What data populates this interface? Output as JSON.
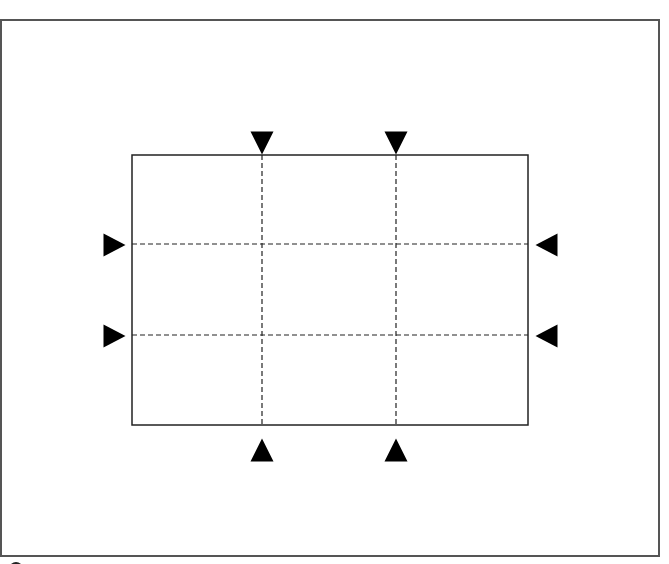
{
  "diagram": {
    "colors": {
      "background": "#ffffff",
      "frame_stroke": "#555555",
      "rect_stroke": "#222222",
      "grid_stroke": "#222222",
      "marker_fill": "#000000"
    },
    "outer_frame": {
      "x": 1,
      "y": 20,
      "width": 658,
      "height": 536
    },
    "inner_rect": {
      "x": 132,
      "y": 155,
      "width": 396,
      "height": 270
    },
    "grid_lines": {
      "vertical_x": [
        262,
        396
      ],
      "horizontal_y": [
        244,
        335
      ],
      "dash": "5,3"
    },
    "markers": [
      {
        "name": "top-marker-left",
        "direction": "down",
        "x": 262,
        "y": 143
      },
      {
        "name": "top-marker-right",
        "direction": "down",
        "x": 396,
        "y": 143
      },
      {
        "name": "bottom-marker-left",
        "direction": "up",
        "x": 262,
        "y": 450
      },
      {
        "name": "bottom-marker-right",
        "direction": "up",
        "x": 396,
        "y": 450
      },
      {
        "name": "left-marker-top",
        "direction": "right",
        "x": 114,
        "y": 245
      },
      {
        "name": "left-marker-bottom",
        "direction": "right",
        "x": 114,
        "y": 336
      },
      {
        "name": "right-marker-top",
        "direction": "left",
        "x": 547,
        "y": 245
      },
      {
        "name": "right-marker-bottom",
        "direction": "left",
        "x": 547,
        "y": 336
      }
    ],
    "marker_size": 23
  }
}
